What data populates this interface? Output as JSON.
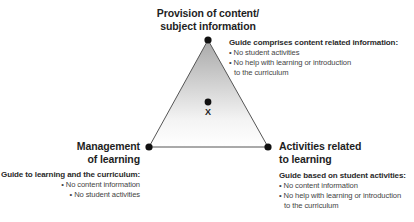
{
  "diagram": {
    "vertices": {
      "top": {
        "label_lines": [
          "Provision of content/",
          "subject information"
        ],
        "description_title": "Guide comprises content related information:",
        "bullets": [
          "• No student activities",
          "• No help with learning or introduction"
        ],
        "bullet_continuation": "to the curriculum"
      },
      "left": {
        "label_lines": [
          "Management",
          "of learning"
        ],
        "description_title": "Guide to learning and the curriculum:",
        "bullets": [
          "• No content information",
          "• No student activities"
        ]
      },
      "right": {
        "label_lines": [
          "Activities related",
          "to learning"
        ],
        "description_title": "Guide based on student activities:",
        "bullets": [
          "•  No content information",
          "• No help with learning or introduction"
        ],
        "bullet_continuation": "to the curriculum"
      }
    },
    "center_marker": {
      "label": "X"
    },
    "colors": {
      "gradient_top": "#a8a8a8",
      "gradient_bottom": "#ffffff",
      "edge": "#555555",
      "dot": "#111111"
    }
  }
}
